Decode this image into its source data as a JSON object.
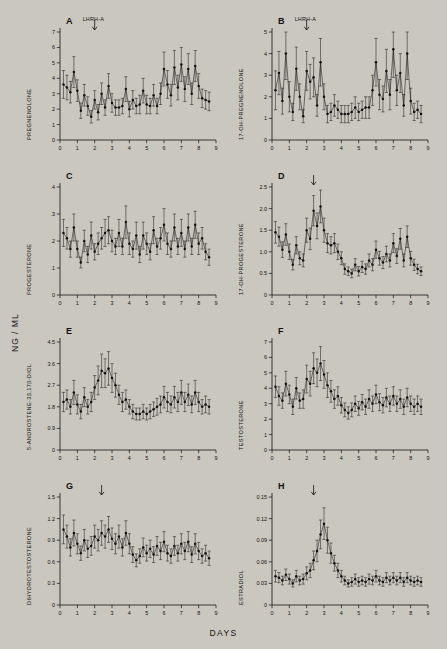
{
  "figure": {
    "y_axis_title": "NG / ML",
    "x_axis_title": "DAYS",
    "background": "#cac7be",
    "ink": "#111111"
  },
  "chart_data": [
    {
      "type": "line",
      "panel": "A",
      "title": "A",
      "ylabel": "PREGNENOLONE",
      "xlabel": "",
      "annotation": "LHRH-A",
      "annotation_x": 2.0,
      "xlim": [
        0,
        9
      ],
      "ylim": [
        0,
        7
      ],
      "xticks": [
        0,
        1,
        2,
        3,
        4,
        5,
        6,
        7,
        8,
        9
      ],
      "yticks": [
        0,
        1,
        2,
        3,
        4,
        5,
        6,
        7
      ],
      "grid": false,
      "x": [
        0.2,
        0.4,
        0.6,
        0.8,
        1.0,
        1.2,
        1.4,
        1.6,
        1.8,
        2.0,
        2.2,
        2.4,
        2.6,
        2.8,
        3.0,
        3.2,
        3.4,
        3.6,
        3.8,
        4.0,
        4.2,
        4.4,
        4.6,
        4.8,
        5.0,
        5.2,
        5.4,
        5.6,
        5.8,
        6.0,
        6.2,
        6.4,
        6.6,
        6.8,
        7.0,
        7.2,
        7.4,
        7.6,
        7.8,
        8.0,
        8.2,
        8.4,
        8.6
      ],
      "values": [
        3.6,
        3.4,
        3.1,
        4.4,
        3.2,
        1.9,
        2.9,
        2.2,
        1.5,
        2.6,
        1.8,
        3.0,
        2.1,
        3.5,
        2.4,
        2.1,
        2.1,
        2.2,
        3.3,
        2.0,
        2.6,
        2.2,
        2.3,
        3.2,
        2.3,
        2.2,
        2.9,
        2.2,
        3.0,
        4.6,
        3.6,
        2.9,
        4.7,
        3.4,
        4.9,
        3.3,
        4.6,
        3.0,
        4.8,
        3.5,
        2.7,
        2.6,
        2.5
      ],
      "errors": [
        0.9,
        0.8,
        0.7,
        1.0,
        0.7,
        0.5,
        0.7,
        0.6,
        0.4,
        0.6,
        0.5,
        0.7,
        0.5,
        0.8,
        0.6,
        0.5,
        0.5,
        0.5,
        0.8,
        0.5,
        0.6,
        0.5,
        0.6,
        0.8,
        0.6,
        0.5,
        0.7,
        0.5,
        0.7,
        1.1,
        0.9,
        0.7,
        1.1,
        0.8,
        1.1,
        0.8,
        1.0,
        0.7,
        1.0,
        0.8,
        0.6,
        0.6,
        0.6
      ]
    },
    {
      "type": "line",
      "panel": "B",
      "title": "B",
      "ylabel": "17-OH-PREGNENOLONE",
      "xlabel": "",
      "annotation": "LHRH-A",
      "annotation_x": 2.0,
      "xlim": [
        0,
        9
      ],
      "ylim": [
        0,
        5
      ],
      "xticks": [
        0,
        1,
        2,
        3,
        4,
        5,
        6,
        7,
        8,
        9
      ],
      "yticks": [
        0,
        1,
        2,
        3,
        4,
        5
      ],
      "grid": false,
      "x": [
        0.2,
        0.4,
        0.6,
        0.8,
        1.0,
        1.2,
        1.4,
        1.6,
        1.8,
        2.0,
        2.2,
        2.4,
        2.6,
        2.8,
        3.0,
        3.2,
        3.4,
        3.6,
        3.8,
        4.0,
        4.2,
        4.4,
        4.6,
        4.8,
        5.0,
        5.2,
        5.4,
        5.6,
        5.8,
        6.0,
        6.2,
        6.4,
        6.6,
        6.8,
        7.0,
        7.2,
        7.4,
        7.6,
        7.8,
        8.0,
        8.2,
        8.4,
        8.6
      ],
      "values": [
        2.3,
        3.1,
        1.8,
        4.0,
        2.0,
        1.3,
        3.3,
        2.0,
        1.1,
        3.2,
        2.7,
        2.9,
        1.6,
        3.6,
        2.0,
        1.2,
        1.3,
        1.6,
        1.4,
        1.2,
        1.2,
        1.2,
        1.3,
        1.5,
        1.3,
        1.4,
        1.5,
        1.5,
        2.3,
        3.6,
        2.1,
        1.9,
        3.2,
        2.1,
        4.2,
        2.3,
        3.1,
        1.6,
        4.0,
        1.8,
        1.3,
        1.4,
        1.2
      ],
      "errors": [
        0.9,
        1.0,
        0.6,
        1.2,
        0.7,
        0.4,
        1.0,
        0.6,
        0.3,
        0.9,
        0.8,
        0.9,
        0.5,
        1.1,
        0.6,
        0.4,
        0.4,
        0.5,
        0.4,
        0.4,
        0.4,
        0.4,
        0.4,
        0.5,
        0.4,
        0.4,
        0.5,
        0.5,
        0.7,
        1.1,
        0.7,
        0.6,
        1.0,
        0.7,
        1.3,
        0.7,
        0.9,
        0.5,
        1.2,
        0.6,
        0.4,
        0.4,
        0.4
      ]
    },
    {
      "type": "line",
      "panel": "C",
      "title": "C",
      "ylabel": "PROGESTERONE",
      "xlabel": "",
      "annotation": "",
      "annotation_x": null,
      "xlim": [
        0,
        9
      ],
      "ylim": [
        0,
        0.4
      ],
      "xticks": [
        0,
        1,
        2,
        3,
        4,
        5,
        6,
        7,
        8,
        9
      ],
      "yticks": [
        0,
        0.1,
        0.2,
        0.3,
        0.4
      ],
      "ytick_labels": [
        "0",
        ".1",
        ".2",
        ".3",
        ".4"
      ],
      "grid": false,
      "x": [
        0.2,
        0.4,
        0.6,
        0.8,
        1.0,
        1.2,
        1.4,
        1.6,
        1.8,
        2.0,
        2.2,
        2.4,
        2.6,
        2.8,
        3.0,
        3.2,
        3.4,
        3.6,
        3.8,
        4.0,
        4.2,
        4.4,
        4.6,
        4.8,
        5.0,
        5.2,
        5.4,
        5.6,
        5.8,
        6.0,
        6.2,
        6.4,
        6.6,
        6.8,
        7.0,
        7.2,
        7.4,
        7.6,
        7.8,
        8.0,
        8.2,
        8.4,
        8.6
      ],
      "values": [
        0.23,
        0.21,
        0.17,
        0.25,
        0.17,
        0.12,
        0.2,
        0.15,
        0.22,
        0.16,
        0.19,
        0.21,
        0.23,
        0.24,
        0.2,
        0.18,
        0.23,
        0.18,
        0.27,
        0.19,
        0.17,
        0.22,
        0.15,
        0.22,
        0.19,
        0.16,
        0.24,
        0.18,
        0.21,
        0.26,
        0.19,
        0.17,
        0.25,
        0.18,
        0.23,
        0.17,
        0.25,
        0.18,
        0.26,
        0.19,
        0.21,
        0.16,
        0.14
      ],
      "errors": [
        0.05,
        0.04,
        0.03,
        0.05,
        0.03,
        0.02,
        0.04,
        0.03,
        0.05,
        0.03,
        0.04,
        0.04,
        0.05,
        0.05,
        0.04,
        0.03,
        0.05,
        0.03,
        0.06,
        0.04,
        0.03,
        0.05,
        0.03,
        0.05,
        0.04,
        0.03,
        0.05,
        0.03,
        0.04,
        0.06,
        0.04,
        0.03,
        0.05,
        0.03,
        0.05,
        0.03,
        0.05,
        0.03,
        0.05,
        0.04,
        0.04,
        0.03,
        0.03
      ]
    },
    {
      "type": "line",
      "panel": "D",
      "title": "D",
      "ylabel": "17-OH-PROGESTERONE",
      "xlabel": "",
      "annotation": "",
      "annotation_x": 2.4,
      "xlim": [
        0,
        9
      ],
      "ylim": [
        0,
        2.5
      ],
      "xticks": [
        0,
        1,
        2,
        3,
        4,
        5,
        6,
        7,
        8,
        9
      ],
      "yticks": [
        0,
        0.5,
        1.0,
        1.5,
        2.0,
        2.5
      ],
      "ytick_labels": [
        "0",
        "0.5",
        "1.0",
        "1.5",
        "2.0",
        "2.5"
      ],
      "grid": false,
      "x": [
        0.2,
        0.4,
        0.6,
        0.8,
        1.0,
        1.2,
        1.4,
        1.6,
        1.8,
        2.0,
        2.2,
        2.4,
        2.6,
        2.8,
        3.0,
        3.2,
        3.4,
        3.6,
        3.8,
        4.0,
        4.2,
        4.4,
        4.6,
        4.8,
        5.0,
        5.2,
        5.4,
        5.6,
        5.8,
        6.0,
        6.2,
        6.4,
        6.6,
        6.8,
        7.0,
        7.2,
        7.4,
        7.6,
        7.8,
        8.0,
        8.2,
        8.4,
        8.6
      ],
      "values": [
        1.45,
        1.35,
        1.05,
        1.4,
        1.0,
        0.7,
        1.15,
        0.85,
        0.8,
        1.5,
        1.3,
        1.95,
        1.6,
        2.05,
        1.5,
        1.2,
        1.15,
        1.2,
        1.0,
        0.85,
        0.6,
        0.55,
        0.5,
        0.7,
        0.55,
        0.65,
        0.6,
        0.8,
        0.7,
        1.05,
        0.85,
        0.75,
        0.95,
        0.8,
        1.2,
        0.9,
        1.3,
        0.8,
        1.35,
        0.85,
        0.7,
        0.6,
        0.55
      ],
      "errors": [
        0.25,
        0.22,
        0.18,
        0.25,
        0.18,
        0.12,
        0.2,
        0.15,
        0.15,
        0.28,
        0.25,
        0.35,
        0.3,
        0.38,
        0.28,
        0.22,
        0.2,
        0.22,
        0.18,
        0.15,
        0.12,
        0.1,
        0.1,
        0.14,
        0.11,
        0.13,
        0.12,
        0.15,
        0.14,
        0.2,
        0.16,
        0.14,
        0.18,
        0.15,
        0.22,
        0.17,
        0.24,
        0.15,
        0.25,
        0.16,
        0.13,
        0.11,
        0.1
      ]
    },
    {
      "type": "line",
      "panel": "E",
      "title": "E",
      "ylabel": "5-ANDROSTENE-3β,17β-DIOL",
      "xlabel": "",
      "annotation": "",
      "annotation_x": null,
      "xlim": [
        0,
        9
      ],
      "ylim": [
        0,
        4.5
      ],
      "xticks": [
        0,
        1,
        2,
        3,
        4,
        5,
        6,
        7,
        8,
        9
      ],
      "yticks": [
        0,
        0.9,
        1.8,
        2.7,
        3.6,
        4.5
      ],
      "ytick_labels": [
        "0",
        "0.9",
        "1.8",
        "2.7",
        "3.6",
        "4.5"
      ],
      "grid": false,
      "x": [
        0.2,
        0.4,
        0.6,
        0.8,
        1.0,
        1.2,
        1.4,
        1.6,
        1.8,
        2.0,
        2.2,
        2.4,
        2.6,
        2.8,
        3.0,
        3.2,
        3.4,
        3.6,
        3.8,
        4.0,
        4.2,
        4.4,
        4.6,
        4.8,
        5.0,
        5.2,
        5.4,
        5.6,
        5.8,
        6.0,
        6.2,
        6.4,
        6.6,
        6.8,
        7.0,
        7.2,
        7.4,
        7.6,
        7.8,
        8.0,
        8.2,
        8.4,
        8.6
      ],
      "values": [
        2.0,
        2.1,
        1.8,
        2.4,
        1.9,
        1.6,
        2.2,
        1.8,
        2.0,
        2.6,
        2.9,
        3.3,
        3.2,
        3.4,
        3.0,
        2.7,
        2.3,
        2.0,
        2.1,
        1.8,
        1.6,
        1.5,
        1.5,
        1.6,
        1.5,
        1.6,
        1.7,
        1.8,
        1.9,
        2.2,
        2.0,
        1.9,
        2.2,
        2.0,
        2.4,
        2.0,
        2.3,
        1.9,
        2.4,
        2.0,
        1.8,
        1.9,
        1.8
      ],
      "errors": [
        0.4,
        0.4,
        0.3,
        0.5,
        0.4,
        0.3,
        0.4,
        0.3,
        0.4,
        0.5,
        0.6,
        0.7,
        0.6,
        0.7,
        0.6,
        0.5,
        0.4,
        0.4,
        0.4,
        0.3,
        0.3,
        0.25,
        0.25,
        0.3,
        0.25,
        0.3,
        0.3,
        0.35,
        0.35,
        0.45,
        0.4,
        0.35,
        0.45,
        0.4,
        0.5,
        0.4,
        0.45,
        0.35,
        0.5,
        0.4,
        0.3,
        0.35,
        0.3
      ]
    },
    {
      "type": "line",
      "panel": "F",
      "title": "F",
      "ylabel": "TESTOSTERONE",
      "xlabel": "",
      "annotation": "",
      "annotation_x": null,
      "xlim": [
        0,
        9
      ],
      "ylim": [
        0,
        7
      ],
      "xticks": [
        0,
        1,
        2,
        3,
        4,
        5,
        6,
        7,
        8,
        9
      ],
      "yticks": [
        0,
        1,
        2,
        3,
        4,
        5,
        6,
        7
      ],
      "grid": false,
      "x": [
        0.2,
        0.4,
        0.6,
        0.8,
        1.0,
        1.2,
        1.4,
        1.6,
        1.8,
        2.0,
        2.2,
        2.4,
        2.6,
        2.8,
        3.0,
        3.2,
        3.4,
        3.6,
        3.8,
        4.0,
        4.2,
        4.4,
        4.6,
        4.8,
        5.0,
        5.2,
        5.4,
        5.6,
        5.8,
        6.0,
        6.2,
        6.4,
        6.6,
        6.8,
        7.0,
        7.2,
        7.4,
        7.6,
        7.8,
        8.0,
        8.2,
        8.4,
        8.6
      ],
      "values": [
        4.1,
        3.5,
        3.2,
        4.3,
        3.6,
        2.8,
        4.0,
        3.2,
        3.3,
        4.6,
        4.3,
        5.3,
        5.0,
        5.6,
        4.9,
        4.2,
        3.8,
        3.3,
        3.5,
        2.9,
        2.6,
        2.4,
        2.6,
        3.0,
        2.7,
        3.1,
        2.8,
        3.3,
        3.0,
        3.6,
        3.1,
        2.9,
        3.4,
        3.0,
        3.5,
        3.0,
        3.3,
        2.8,
        3.4,
        3.0,
        2.8,
        3.0,
        2.8
      ],
      "errors": [
        0.7,
        0.6,
        0.5,
        0.8,
        0.6,
        0.5,
        0.7,
        0.5,
        0.6,
        0.9,
        0.8,
        1.0,
        0.9,
        1.1,
        0.9,
        0.8,
        0.7,
        0.6,
        0.6,
        0.5,
        0.45,
        0.4,
        0.45,
        0.5,
        0.45,
        0.5,
        0.5,
        0.6,
        0.5,
        0.6,
        0.55,
        0.5,
        0.6,
        0.5,
        0.6,
        0.5,
        0.6,
        0.5,
        0.6,
        0.5,
        0.5,
        0.5,
        0.5
      ]
    },
    {
      "type": "line",
      "panel": "G",
      "title": "G",
      "ylabel": "DIHYDROTESTOSTERONE",
      "xlabel": "",
      "annotation": "",
      "annotation_x": 2.4,
      "xlim": [
        0,
        9
      ],
      "ylim": [
        0,
        1.5
      ],
      "xticks": [
        0,
        1,
        2,
        3,
        4,
        5,
        6,
        7,
        8,
        9
      ],
      "yticks": [
        0,
        0.3,
        0.6,
        0.9,
        1.2,
        1.5
      ],
      "ytick_labels": [
        "0",
        "0.3",
        "0.6",
        "0.9",
        "1.2",
        "1.5"
      ],
      "grid": false,
      "x": [
        0.2,
        0.4,
        0.6,
        0.8,
        1.0,
        1.2,
        1.4,
        1.6,
        1.8,
        2.0,
        2.2,
        2.4,
        2.6,
        2.8,
        3.0,
        3.2,
        3.4,
        3.6,
        3.8,
        4.0,
        4.2,
        4.4,
        4.6,
        4.8,
        5.0,
        5.2,
        5.4,
        5.6,
        5.8,
        6.0,
        6.2,
        6.4,
        6.6,
        6.8,
        7.0,
        7.2,
        7.4,
        7.6,
        7.8,
        8.0,
        8.2,
        8.4,
        8.6
      ],
      "values": [
        1.05,
        0.95,
        0.8,
        1.0,
        0.85,
        0.72,
        0.9,
        0.78,
        0.82,
        0.95,
        0.9,
        1.0,
        0.95,
        1.05,
        0.92,
        0.85,
        0.95,
        0.8,
        1.0,
        0.85,
        0.7,
        0.62,
        0.68,
        0.8,
        0.72,
        0.78,
        0.7,
        0.82,
        0.75,
        0.88,
        0.72,
        0.68,
        0.82,
        0.72,
        0.85,
        0.75,
        0.88,
        0.7,
        0.85,
        0.75,
        0.68,
        0.72,
        0.65
      ],
      "errors": [
        0.2,
        0.16,
        0.12,
        0.18,
        0.14,
        0.1,
        0.15,
        0.12,
        0.13,
        0.16,
        0.15,
        0.17,
        0.16,
        0.18,
        0.15,
        0.14,
        0.16,
        0.12,
        0.17,
        0.14,
        0.11,
        0.09,
        0.1,
        0.13,
        0.11,
        0.12,
        0.11,
        0.13,
        0.12,
        0.14,
        0.11,
        0.1,
        0.13,
        0.11,
        0.14,
        0.12,
        0.14,
        0.11,
        0.14,
        0.12,
        0.1,
        0.11,
        0.1
      ]
    },
    {
      "type": "line",
      "panel": "H",
      "title": "H",
      "ylabel": "ESTRADIOL",
      "xlabel": "",
      "annotation": "",
      "annotation_x": 2.4,
      "xlim": [
        0,
        9
      ],
      "ylim": [
        0,
        0.15
      ],
      "xticks": [
        0,
        1,
        2,
        3,
        4,
        5,
        6,
        7,
        8,
        9
      ],
      "yticks": [
        0,
        0.03,
        0.06,
        0.09,
        0.12,
        0.15
      ],
      "ytick_labels": [
        "0",
        "0.03",
        "0.06",
        "0.09",
        "0.12",
        "0.15"
      ],
      "grid": false,
      "x": [
        0.2,
        0.4,
        0.6,
        0.8,
        1.0,
        1.2,
        1.4,
        1.6,
        1.8,
        2.0,
        2.2,
        2.4,
        2.6,
        2.8,
        3.0,
        3.2,
        3.4,
        3.6,
        3.8,
        4.0,
        4.2,
        4.4,
        4.6,
        4.8,
        5.0,
        5.2,
        5.4,
        5.6,
        5.8,
        6.0,
        6.2,
        6.4,
        6.6,
        6.8,
        7.0,
        7.2,
        7.4,
        7.6,
        7.8,
        8.0,
        8.2,
        8.4,
        8.6
      ],
      "values": [
        0.04,
        0.038,
        0.034,
        0.042,
        0.036,
        0.03,
        0.04,
        0.034,
        0.036,
        0.044,
        0.048,
        0.062,
        0.075,
        0.098,
        0.113,
        0.09,
        0.072,
        0.058,
        0.048,
        0.04,
        0.034,
        0.03,
        0.032,
        0.036,
        0.032,
        0.034,
        0.032,
        0.036,
        0.034,
        0.04,
        0.034,
        0.032,
        0.038,
        0.034,
        0.038,
        0.034,
        0.038,
        0.032,
        0.038,
        0.034,
        0.032,
        0.034,
        0.032
      ],
      "errors": [
        0.008,
        0.007,
        0.006,
        0.008,
        0.007,
        0.005,
        0.008,
        0.006,
        0.007,
        0.009,
        0.01,
        0.013,
        0.015,
        0.02,
        0.022,
        0.018,
        0.014,
        0.011,
        0.01,
        0.008,
        0.006,
        0.005,
        0.006,
        0.007,
        0.006,
        0.006,
        0.006,
        0.007,
        0.006,
        0.008,
        0.006,
        0.006,
        0.007,
        0.006,
        0.007,
        0.006,
        0.007,
        0.006,
        0.007,
        0.006,
        0.006,
        0.006,
        0.006
      ]
    }
  ]
}
